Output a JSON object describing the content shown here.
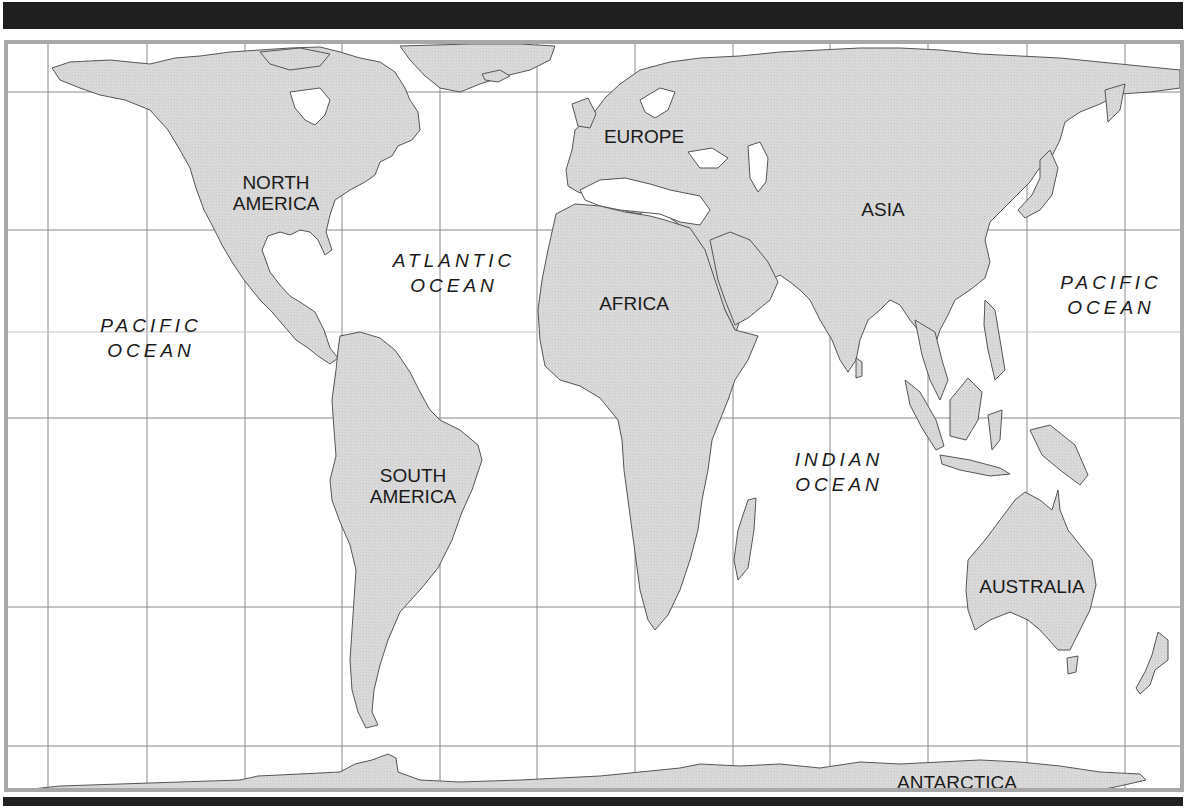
{
  "map": {
    "type": "world-outline-map",
    "colors": {
      "land": "#d9d9d9",
      "land_outline": "#555555",
      "ocean": "#ffffff",
      "grid": "#8a8a8a",
      "frame": "#a8a8a8",
      "bars": "#1e1e1e",
      "text": "#1a1a1a"
    },
    "grid": {
      "vertical_x": [
        48,
        147,
        245,
        342,
        440,
        537,
        635,
        733,
        830,
        928,
        1027,
        1125
      ],
      "horizontal_y": [
        72,
        230,
        418,
        607,
        746
      ],
      "equator_y": 332
    },
    "continents": [
      {
        "id": "north-america",
        "line1": "NORTH",
        "line2": "AMERICA",
        "x": 272,
        "y": 190
      },
      {
        "id": "south-america",
        "line1": "SOUTH",
        "line2": "AMERICA",
        "x": 409,
        "y": 483
      },
      {
        "id": "europe",
        "line1": "EUROPE",
        "x": 640,
        "y": 133
      },
      {
        "id": "asia",
        "line1": "ASIA",
        "x": 879,
        "y": 206
      },
      {
        "id": "africa",
        "line1": "AFRICA",
        "x": 630,
        "y": 300
      },
      {
        "id": "australia",
        "line1": "AUSTRALIA",
        "x": 1028,
        "y": 583
      },
      {
        "id": "antarctica",
        "line1": "ANTARCTICA",
        "x": 953,
        "y": 779
      }
    ],
    "oceans": [
      {
        "id": "pacific-ocean-west",
        "line1": "PACIFIC",
        "line2": "OCEAN",
        "x": 147,
        "y": 335
      },
      {
        "id": "atlantic-ocean",
        "line1": "ATLANTIC",
        "line2": "OCEAN",
        "x": 450,
        "y": 270
      },
      {
        "id": "indian-ocean",
        "line1": "INDIAN",
        "line2": "OCEAN",
        "x": 835,
        "y": 469
      },
      {
        "id": "pacific-ocean-east",
        "line1": "PACIFIC",
        "line2": "OCEAN",
        "x": 1107,
        "y": 292
      }
    ]
  }
}
